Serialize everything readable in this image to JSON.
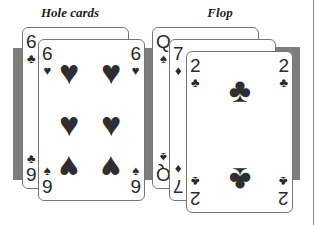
{
  "labels": {
    "hole": "Hole cards",
    "flop": "Flop"
  },
  "colors": {
    "ink": "#2e2e2e",
    "strip": "#7d7d7d",
    "border": "#777777"
  },
  "hole_cards": [
    {
      "rank": "6",
      "suit": "♣",
      "suit_name": "clubs",
      "bottom_rank": "9",
      "bottom_suit": "♣"
    },
    {
      "rank": "6",
      "suit": "♥",
      "suit_name": "hearts",
      "bottom_rank": "9",
      "bottom_suit": "♠",
      "pip": "♥"
    }
  ],
  "flop_cards": [
    {
      "rank": "Q",
      "suit": "♠",
      "suit_name": "spades"
    },
    {
      "rank": "7",
      "suit": "♦",
      "suit_name": "diamonds"
    },
    {
      "rank": "2",
      "suit": "♣",
      "suit_name": "clubs",
      "pip": "♣"
    }
  ]
}
